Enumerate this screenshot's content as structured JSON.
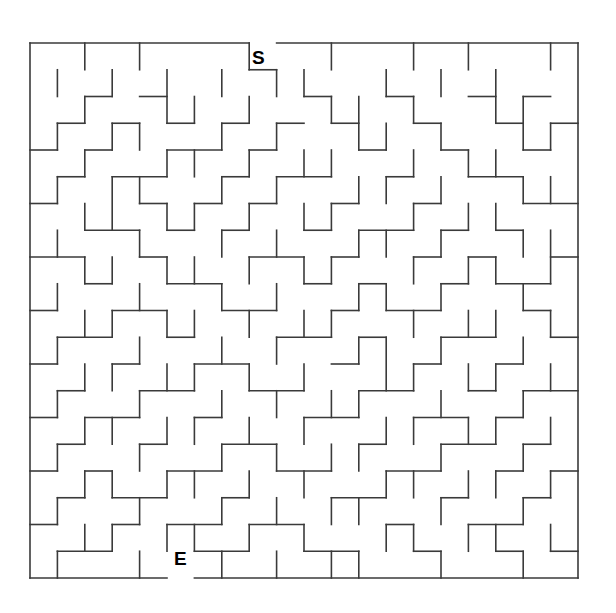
{
  "figure": {
    "kind": "maze-puzzle",
    "background_color": "#ffffff",
    "wall_color": "#3a3a3a",
    "wall_thickness": 1.6,
    "border_thickness": 1.6
  },
  "maze": {
    "columns": 20,
    "rows": 20,
    "origin_x": 30,
    "origin_y": 43,
    "cell_width": 27.4,
    "cell_height": 26.75,
    "start_label": "S",
    "end_label": "E",
    "start_opening_column": 8,
    "end_opening_column": 5,
    "border_top_segments": [
      [
        0,
        8
      ],
      [
        9,
        20
      ]
    ],
    "border_bottom_segments": [
      [
        0,
        5
      ],
      [
        6,
        20
      ]
    ],
    "border_left": true,
    "border_right": true,
    "h_walls": [
      [
        0,
        0,
        0,
        0,
        0,
        0,
        0,
        0,
        1,
        0,
        0,
        0,
        0,
        0,
        0,
        0,
        0,
        0,
        0,
        0
      ],
      [
        0,
        0,
        1,
        0,
        1,
        0,
        0,
        0,
        0,
        0,
        1,
        0,
        0,
        1,
        0,
        0,
        1,
        0,
        1,
        0
      ],
      [
        0,
        1,
        0,
        1,
        0,
        1,
        0,
        1,
        0,
        1,
        0,
        1,
        0,
        0,
        1,
        0,
        0,
        1,
        0,
        1
      ],
      [
        1,
        0,
        1,
        0,
        0,
        1,
        1,
        0,
        1,
        0,
        0,
        0,
        1,
        0,
        0,
        1,
        0,
        0,
        1,
        0
      ],
      [
        0,
        1,
        0,
        1,
        1,
        0,
        0,
        1,
        0,
        1,
        1,
        0,
        0,
        1,
        0,
        0,
        1,
        1,
        0,
        0
      ],
      [
        1,
        0,
        0,
        0,
        1,
        0,
        1,
        0,
        1,
        0,
        0,
        1,
        0,
        0,
        1,
        0,
        0,
        0,
        1,
        1
      ],
      [
        0,
        0,
        1,
        1,
        0,
        1,
        0,
        1,
        0,
        0,
        1,
        0,
        1,
        1,
        0,
        1,
        0,
        1,
        0,
        0
      ],
      [
        1,
        1,
        0,
        0,
        1,
        0,
        0,
        0,
        1,
        1,
        0,
        1,
        0,
        0,
        1,
        0,
        1,
        0,
        0,
        1
      ],
      [
        0,
        0,
        1,
        0,
        0,
        1,
        1,
        0,
        0,
        0,
        1,
        0,
        1,
        0,
        0,
        1,
        0,
        1,
        1,
        0
      ],
      [
        1,
        0,
        0,
        1,
        1,
        0,
        0,
        1,
        1,
        0,
        0,
        1,
        0,
        1,
        1,
        0,
        0,
        0,
        1,
        0
      ],
      [
        0,
        1,
        1,
        0,
        0,
        1,
        0,
        0,
        0,
        1,
        1,
        0,
        1,
        0,
        0,
        1,
        1,
        0,
        0,
        1
      ],
      [
        1,
        0,
        0,
        1,
        0,
        0,
        1,
        1,
        0,
        0,
        0,
        1,
        0,
        0,
        1,
        0,
        0,
        1,
        0,
        0
      ],
      [
        0,
        1,
        0,
        0,
        1,
        1,
        0,
        0,
        1,
        1,
        0,
        0,
        1,
        1,
        0,
        0,
        1,
        0,
        1,
        1
      ],
      [
        1,
        0,
        1,
        1,
        0,
        0,
        1,
        0,
        0,
        0,
        1,
        1,
        0,
        0,
        1,
        1,
        0,
        1,
        0,
        0
      ],
      [
        0,
        1,
        0,
        0,
        1,
        0,
        0,
        1,
        1,
        0,
        0,
        0,
        1,
        0,
        0,
        1,
        1,
        0,
        1,
        0
      ],
      [
        1,
        0,
        1,
        0,
        0,
        1,
        1,
        0,
        0,
        1,
        1,
        0,
        0,
        1,
        1,
        0,
        0,
        1,
        0,
        1
      ],
      [
        0,
        1,
        0,
        1,
        1,
        0,
        0,
        1,
        0,
        0,
        0,
        1,
        1,
        0,
        0,
        1,
        0,
        0,
        1,
        0
      ],
      [
        1,
        0,
        0,
        1,
        0,
        1,
        1,
        0,
        1,
        1,
        0,
        0,
        0,
        1,
        0,
        0,
        1,
        1,
        0,
        0
      ],
      [
        0,
        1,
        1,
        0,
        0,
        0,
        1,
        1,
        0,
        0,
        1,
        1,
        0,
        0,
        1,
        0,
        0,
        1,
        0,
        1
      ],
      [
        1,
        0,
        0,
        1,
        1,
        0,
        0,
        0,
        1,
        0,
        0,
        1,
        1,
        0,
        0,
        1,
        1,
        0,
        0,
        0
      ]
    ],
    "v_walls": [
      [
        0,
        1,
        0,
        1,
        0,
        0,
        0,
        1,
        0,
        0,
        1,
        0,
        0,
        1,
        0,
        1,
        0,
        0,
        1
      ],
      [
        1,
        0,
        1,
        0,
        1,
        0,
        1,
        0,
        1,
        1,
        0,
        0,
        1,
        0,
        1,
        0,
        1,
        0,
        0
      ],
      [
        0,
        1,
        0,
        0,
        1,
        1,
        0,
        1,
        0,
        0,
        1,
        1,
        0,
        1,
        0,
        0,
        1,
        1,
        0
      ],
      [
        1,
        0,
        1,
        1,
        0,
        0,
        1,
        0,
        1,
        0,
        0,
        1,
        1,
        0,
        1,
        0,
        0,
        1,
        1
      ],
      [
        0,
        1,
        0,
        0,
        1,
        1,
        0,
        1,
        0,
        1,
        1,
        0,
        0,
        1,
        0,
        1,
        1,
        0,
        0
      ],
      [
        1,
        0,
        1,
        1,
        0,
        0,
        1,
        0,
        1,
        0,
        0,
        1,
        1,
        0,
        1,
        0,
        0,
        1,
        1
      ],
      [
        0,
        1,
        1,
        0,
        1,
        1,
        0,
        1,
        0,
        1,
        1,
        0,
        0,
        1,
        0,
        1,
        1,
        0,
        0
      ],
      [
        1,
        0,
        0,
        1,
        0,
        0,
        1,
        0,
        1,
        0,
        0,
        1,
        1,
        0,
        1,
        0,
        0,
        1,
        1
      ],
      [
        0,
        1,
        1,
        0,
        1,
        1,
        0,
        1,
        0,
        1,
        1,
        0,
        0,
        1,
        0,
        1,
        1,
        0,
        1
      ],
      [
        1,
        0,
        0,
        1,
        0,
        0,
        1,
        0,
        1,
        0,
        0,
        1,
        1,
        0,
        1,
        0,
        0,
        1,
        0
      ],
      [
        0,
        1,
        1,
        0,
        1,
        1,
        0,
        1,
        0,
        1,
        1,
        0,
        0,
        1,
        0,
        1,
        1,
        0,
        1
      ],
      [
        1,
        0,
        0,
        1,
        0,
        0,
        1,
        0,
        1,
        0,
        0,
        1,
        1,
        0,
        1,
        0,
        0,
        1,
        0
      ],
      [
        0,
        1,
        1,
        0,
        1,
        1,
        0,
        1,
        0,
        1,
        0,
        0,
        1,
        1,
        0,
        1,
        1,
        0,
        1
      ],
      [
        1,
        0,
        0,
        1,
        0,
        0,
        1,
        0,
        1,
        0,
        1,
        1,
        0,
        0,
        1,
        0,
        0,
        1,
        0
      ],
      [
        0,
        1,
        1,
        0,
        1,
        1,
        0,
        1,
        0,
        1,
        0,
        0,
        1,
        1,
        0,
        1,
        1,
        0,
        1
      ],
      [
        1,
        0,
        0,
        1,
        0,
        0,
        1,
        0,
        1,
        0,
        1,
        1,
        0,
        0,
        1,
        0,
        0,
        1,
        0
      ],
      [
        0,
        1,
        1,
        0,
        1,
        1,
        0,
        1,
        0,
        1,
        0,
        0,
        1,
        1,
        0,
        1,
        1,
        0,
        1
      ],
      [
        1,
        0,
        0,
        1,
        0,
        0,
        1,
        0,
        1,
        0,
        1,
        1,
        0,
        0,
        1,
        0,
        0,
        1,
        0
      ],
      [
        0,
        1,
        1,
        0,
        1,
        1,
        0,
        1,
        0,
        1,
        0,
        0,
        1,
        1,
        0,
        1,
        1,
        0,
        1
      ],
      [
        1,
        0,
        0,
        1,
        0,
        0,
        1,
        0,
        1,
        0,
        1,
        1,
        0,
        0,
        1,
        0,
        0,
        1,
        0
      ]
    ]
  }
}
